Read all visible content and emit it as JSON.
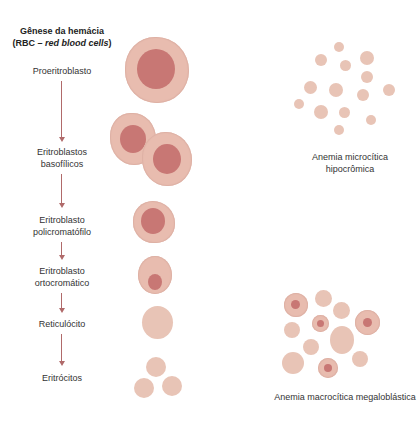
{
  "title": {
    "line1": "Gênese da hemácia",
    "line2_prefix": "(RBC – ",
    "line2_italic": "red blood cells",
    "line2_suffix": ")"
  },
  "stages": [
    {
      "label_lines": [
        "Proeritroblasto"
      ]
    },
    {
      "label_lines": [
        "Eritroblastos",
        "basofílicos"
      ]
    },
    {
      "label_lines": [
        "Eritroblasto",
        "policromatófilo"
      ]
    },
    {
      "label_lines": [
        "Eritroblasto",
        "ortocromático"
      ]
    },
    {
      "label_lines": [
        "Reticulócito"
      ]
    },
    {
      "label_lines": [
        "Eritrócitos"
      ]
    }
  ],
  "panels": {
    "microcytic": {
      "caption_lines": [
        "Anemia microcítica",
        "hipocrômica"
      ]
    },
    "macrocytic": {
      "caption_lines": [
        "Anemia macrocítica megaloblástica"
      ]
    }
  },
  "colors": {
    "cytoplasm": "#e8bcaf",
    "nucleus": "#c87774",
    "mature_rbc": "#e8c4b6",
    "arrow": "#b06a6a"
  }
}
